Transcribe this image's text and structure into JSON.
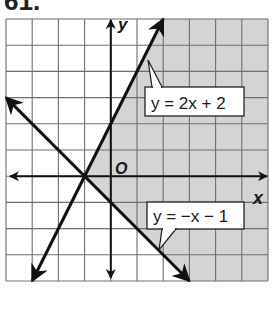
{
  "problem_number": "61.",
  "chart_data": {
    "type": "line",
    "title": "",
    "xlabel": "x",
    "ylabel": "y",
    "origin_label": "O",
    "xlim": [
      -4,
      6
    ],
    "ylim": [
      -4,
      6
    ],
    "grid": true,
    "grid_step": 1,
    "series": [
      {
        "name": "y = 2x + 2",
        "slope": 2,
        "intercept": 2,
        "from": [
          -3,
          -4
        ],
        "to": [
          2,
          6
        ],
        "arrows": "both"
      },
      {
        "name": "y = −x − 1",
        "slope": -1,
        "intercept": -1,
        "from": [
          -4,
          3
        ],
        "to": [
          3,
          -4
        ],
        "arrows": "both"
      }
    ],
    "intersection": [
      -1,
      0
    ],
    "shaded_region": "y ≤ 2x + 2 and y ≥ −x − 1",
    "colors": {
      "shade": "#d4d4d4",
      "grid": "#6e6e6e",
      "line": "#111111",
      "background": "#ffffff"
    }
  },
  "labels": {
    "line1": "y = 2x + 2",
    "line2": "y = −x − 1"
  }
}
